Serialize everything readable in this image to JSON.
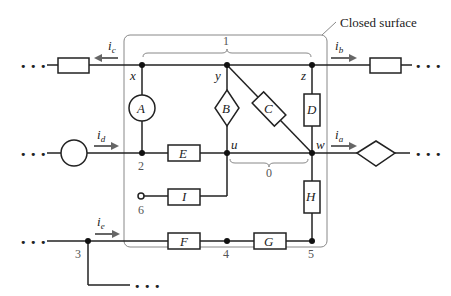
{
  "surface": {
    "label": "Closed surface"
  },
  "elements": {
    "A": "A",
    "B": "B",
    "C": "C",
    "D": "D",
    "E": "E",
    "F": "F",
    "G": "G",
    "H": "H",
    "I": "I"
  },
  "nodes": {
    "x": "x",
    "y": "y",
    "z": "z",
    "u": "u",
    "w": "w",
    "n2": "2",
    "n3": "3",
    "n4": "4",
    "n5": "5",
    "n6": "6"
  },
  "braces": {
    "top": "1",
    "middle": "0"
  },
  "currents": {
    "ic": {
      "base": "i",
      "sub": "c"
    },
    "ib": {
      "base": "i",
      "sub": "b"
    },
    "id": {
      "base": "i",
      "sub": "d"
    },
    "ia": {
      "base": "i",
      "sub": "a"
    },
    "ie": {
      "base": "i",
      "sub": "e"
    }
  },
  "ellipsis": "• • •"
}
